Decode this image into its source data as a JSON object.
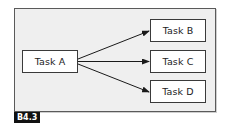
{
  "diagram": {
    "type": "task-dependency",
    "source_task": {
      "id": "task-a",
      "label": "Task A"
    },
    "target_tasks": [
      {
        "id": "task-b",
        "label": "Task B"
      },
      {
        "id": "task-c",
        "label": "Task C"
      },
      {
        "id": "task-d",
        "label": "Task D"
      }
    ],
    "edges": [
      {
        "from": "Task A",
        "to": "Task B"
      },
      {
        "from": "Task A",
        "to": "Task C"
      },
      {
        "from": "Task A",
        "to": "Task D"
      }
    ],
    "figure_label": "B4.3"
  },
  "colors": {
    "frame_fill": "#efefef",
    "frame_border": "#5a5a5a",
    "box_fill": "#ffffff",
    "box_border": "#3a3a3a",
    "arrow": "#1a1a1a",
    "badge_fill": "#111111",
    "badge_text": "#ffffff"
  }
}
